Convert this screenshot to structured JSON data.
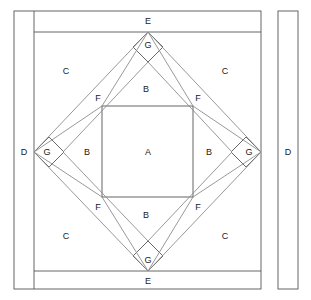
{
  "figure": {
    "type": "quilt-block-piecing-diagram",
    "title": "",
    "stroke_color": "#555555",
    "stroke_color_light": "#8a8a8a",
    "background": "#ffffff",
    "label_color": "#1a1a1a"
  },
  "labels": [
    {
      "id": "lbl-e-top",
      "text": "E",
      "x": 148,
      "y": 21
    },
    {
      "id": "lbl-g-top",
      "text": "G",
      "x": 148,
      "y": 45
    },
    {
      "id": "lbl-c-topleft",
      "text": "C",
      "x": 66,
      "y": 71
    },
    {
      "id": "lbl-c-topright",
      "text": "C",
      "x": 225,
      "y": 71
    },
    {
      "id": "lbl-f-topleft",
      "text": "F",
      "x": 98,
      "y": 98
    },
    {
      "id": "lbl-b-top",
      "text": "B",
      "x": 146,
      "y": 89
    },
    {
      "id": "lbl-f-topright",
      "text": "F",
      "x": 198,
      "y": 98
    },
    {
      "id": "lbl-d-left",
      "text": "D",
      "x": 24,
      "y": 152
    },
    {
      "id": "lbl-g-left",
      "text": "G",
      "x": 47,
      "y": 152
    },
    {
      "id": "lbl-b-left",
      "text": "B",
      "x": 87,
      "y": 152
    },
    {
      "id": "lbl-a-center",
      "text": "A",
      "x": 148,
      "y": 152
    },
    {
      "id": "lbl-b-right",
      "text": "B",
      "x": 209,
      "y": 152
    },
    {
      "id": "lbl-g-right",
      "text": "G",
      "x": 249,
      "y": 152
    },
    {
      "id": "lbl-f-botleft",
      "text": "F",
      "x": 98,
      "y": 207
    },
    {
      "id": "lbl-b-bottom",
      "text": "B",
      "x": 146,
      "y": 215
    },
    {
      "id": "lbl-f-botright",
      "text": "F",
      "x": 198,
      "y": 207
    },
    {
      "id": "lbl-c-botleft",
      "text": "C",
      "x": 66,
      "y": 236
    },
    {
      "id": "lbl-c-botright",
      "text": "C",
      "x": 225,
      "y": 236
    },
    {
      "id": "lbl-g-bottom",
      "text": "G",
      "x": 148,
      "y": 260
    },
    {
      "id": "lbl-e-bottom",
      "text": "E",
      "x": 148,
      "y": 281
    },
    {
      "id": "lbl-d-strip",
      "text": "D",
      "x": 288,
      "y": 152
    }
  ],
  "pieces": [
    {
      "code": "A",
      "name": "center-square"
    },
    {
      "code": "B",
      "name": "inner-band-triangle"
    },
    {
      "code": "C",
      "name": "corner-triangle"
    },
    {
      "code": "D",
      "name": "side-border-strip"
    },
    {
      "code": "E",
      "name": "top-bottom-border-strip"
    },
    {
      "code": "F",
      "name": "diagonal-band-triangle"
    },
    {
      "code": "G",
      "name": "corner-diamond-square"
    }
  ],
  "geometry": {
    "outer_frame": {
      "x1": 14,
      "y1": 11,
      "x2": 261,
      "y2": 289
    },
    "d_strip_left": {
      "x1": 14,
      "y1": 11,
      "x2": 34,
      "y2": 289
    },
    "e_strip_top_line": {
      "x1": 34,
      "y1": 32,
      "x2": 261,
      "y2": 32
    },
    "e_strip_bottom_line": {
      "x1": 34,
      "y1": 271,
      "x2": 261,
      "y2": 271
    },
    "d_strip_right": {
      "x1": 278,
      "y1": 11,
      "x2": 298,
      "y2": 289
    },
    "outer_diamond": {
      "top": [
        148,
        32
      ],
      "right": [
        261,
        152
      ],
      "bottom": [
        148,
        271
      ],
      "left": [
        34,
        152
      ]
    },
    "inner_diamond": {
      "top": [
        148,
        62
      ],
      "right": [
        232,
        152
      ],
      "bottom": [
        148,
        241
      ],
      "left": [
        63,
        152
      ]
    },
    "center_square": {
      "x1": 102,
      "y1": 106,
      "x2": 193,
      "y2": 197
    },
    "g_half_diagonal": 15
  }
}
